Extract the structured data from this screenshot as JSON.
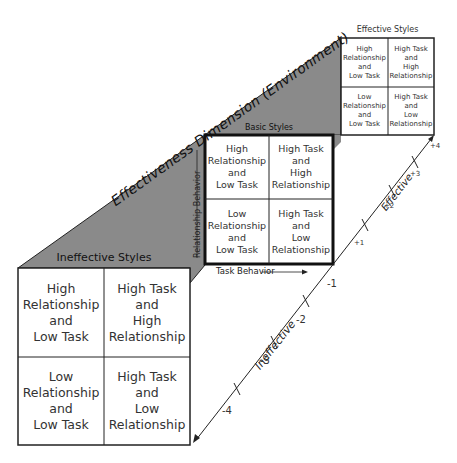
{
  "diagram": {
    "dimension_label": "Effectiveness Dimension (Environment)",
    "colors": {
      "face_gray": "#8a8a8a",
      "line": "#222222",
      "box_fill": "#ffffff"
    },
    "basic": {
      "title": "Basic Styles",
      "y_axis_label": "Relationship Behavior",
      "x_axis_label": "Task Behavior",
      "cells": [
        "High\nRelationship\nand\nLow Task",
        "High Task\nand\nHigh\nRelationship",
        "Low\nRelationship\nand\nLow Task",
        "High Task\nand\nLow\nRelationship"
      ]
    },
    "effective": {
      "title": "Effective Styles",
      "cells": [
        "High\nRelationship\nand\nLow Task",
        "High Task\nand\nHigh\nRelationship",
        "Low\nRelationship\nand\nLow Task",
        "High Task\nand\nLow\nRelationship"
      ]
    },
    "ineffective": {
      "title": "Ineffective Styles",
      "cells": [
        "High\nRelationship\nand\nLow Task",
        "High Task\nand\nHigh\nRelationship",
        "Low\nRelationship\nand\nLow Task",
        "High Task\nand\nLow\nRelationship"
      ]
    },
    "axis": {
      "effective_label": "Effective",
      "ineffective_label": "Ineffective",
      "ticks": [
        "+4",
        "+3",
        "+2",
        "+1",
        "-1",
        "-2",
        "-3",
        "-4"
      ]
    }
  }
}
